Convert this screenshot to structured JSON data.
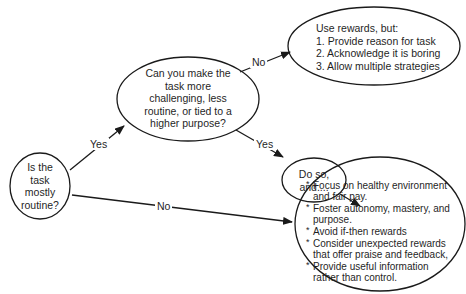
{
  "nodes": {
    "routine": {
      "text_lines": [
        "Is the",
        "task",
        "mostly",
        "routine?"
      ]
    },
    "challenge": {
      "text_lines": [
        "Can you make the",
        "task more",
        "challenging, less",
        "routine, or tied to a",
        "higher purpose?"
      ]
    },
    "use_rewards": {
      "title": "Use rewards, but:",
      "items": [
        "1. Provide reason for task",
        "2. Acknowledge it is boring",
        "3. Allow multiple strategies"
      ]
    },
    "do_so": {
      "text_lines": [
        "Do so,",
        "and...."
      ]
    },
    "recommendations": {
      "items": [
        "Focus on healthy environment and fair pay.",
        "Foster autonomy, mastery, and purpose.",
        "Avoid if-then rewards",
        "Consider unexpected rewards that offer praise and feedback,",
        "Provide useful information rather than control."
      ]
    }
  },
  "edges": {
    "routine_to_challenge": "Yes",
    "challenge_to_use_rewards": "No",
    "challenge_to_do_so": "Yes",
    "routine_to_recommendations": "No"
  },
  "colors": {
    "stroke": "#1a1a1a",
    "background": "#ffffff"
  }
}
